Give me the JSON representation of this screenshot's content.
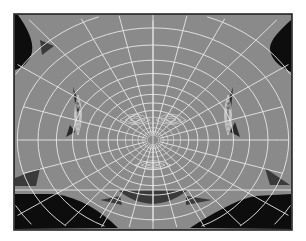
{
  "figure": {
    "title": "",
    "colors": {
      "background": "#ffffff",
      "frame": "#1a1a1a",
      "surface": "#8a8a8a",
      "wire": "#e8e8e8",
      "hole": "#0d0d0d",
      "shadow": "#3a3a3a"
    }
  }
}
